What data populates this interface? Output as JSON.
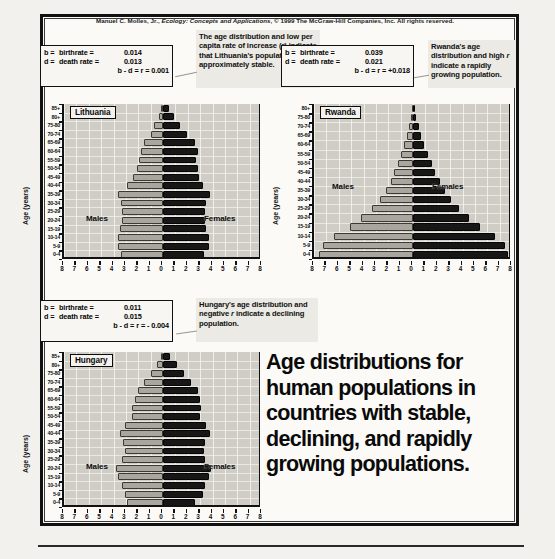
{
  "credit": {
    "prefix": "Manuel C. Molles, Jr., ",
    "italic": "Ecology: Concepts and Applications",
    "suffix": ", © 1999 The McGraw-Hill Companies, Inc. All rights reserved."
  },
  "caption": {
    "line1": "Age distributions for",
    "line2": "human populations in",
    "line3": "countries with stable,",
    "line4": "declining, and rapidly",
    "line5": "growing populations."
  },
  "annotations": {
    "lithuania_stats": {
      "b_label": "b =",
      "b_name": "birthrate =",
      "b_value": "0.014",
      "d_label": "d =",
      "d_name": "death rate =",
      "d_value": "0.013",
      "r_text": "b - d = r = 0.001"
    },
    "lithuania_note": "The age distribution and low per capita rate of increase (r) indicate that Lithuania's population is approximately stable.",
    "rwanda_stats": {
      "b_label": "b =",
      "b_name": "birthrate =",
      "b_value": "0.039",
      "d_label": "d =",
      "d_name": "death rate =",
      "d_value": "0.021",
      "r_text": "b - d = r = +0.018"
    },
    "rwanda_note": "Rwanda's age distribution and high r indicate a rapidly growing population.",
    "hungary_stats": {
      "b_label": "b =",
      "b_name": "birthrate =",
      "b_value": "0.011",
      "d_label": "d =",
      "d_name": "death rate =",
      "d_value": "0.015",
      "r_text": "b - d = r = - 0.004"
    },
    "hungary_note": "Hungary's age distribution and negative r indicate a declining population."
  },
  "common": {
    "ylabel": "Age (years)",
    "males_label": "Males",
    "females_label": "Females",
    "xticks": [
      "8",
      "7",
      "6",
      "5",
      "4",
      "3",
      "2",
      "1",
      "0",
      "1",
      "2",
      "3",
      "4",
      "5",
      "6",
      "7",
      "8"
    ]
  },
  "chart_data": [
    {
      "type": "bar",
      "title": "Lithuania",
      "subtype": "population-pyramid",
      "xlabel": "",
      "ylabel": "Age (years)",
      "xlim": [
        -8,
        8
      ],
      "grid": true,
      "legend_position": "in-plot",
      "categories": [
        "85+",
        "80+",
        "75-80",
        "70-74",
        "65-69",
        "60-64",
        "55-59",
        "50-54",
        "45-49",
        "40-44",
        "35-39",
        "30-34",
        "25-29",
        "20-24",
        "15-19",
        "10-14",
        "5-9",
        "0-4"
      ],
      "series": [
        {
          "name": "Males",
          "values": [
            0.15,
            0.35,
            0.7,
            1.0,
            1.5,
            1.8,
            1.9,
            2.1,
            2.4,
            2.9,
            3.6,
            3.4,
            3.3,
            3.3,
            3.5,
            3.6,
            3.6,
            3.4
          ]
        },
        {
          "name": "Females",
          "values": [
            0.45,
            0.9,
            1.4,
            1.9,
            2.6,
            2.8,
            2.7,
            2.8,
            2.9,
            3.2,
            3.8,
            3.5,
            3.4,
            3.4,
            3.5,
            3.7,
            3.7,
            3.3
          ]
        }
      ]
    },
    {
      "type": "bar",
      "title": "Rwanda",
      "subtype": "population-pyramid",
      "xlabel": "",
      "ylabel": "Age (years)",
      "xlim": [
        -8,
        8
      ],
      "grid": true,
      "legend_position": "in-plot",
      "categories": [
        "80+",
        "75-80",
        "70-74",
        "65-69",
        "60-64",
        "55-59",
        "50-54",
        "45-49",
        "40-44",
        "35-39",
        "30-34",
        "25-29",
        "20-24",
        "15-19",
        "10-14",
        "5-9",
        "0-4"
      ],
      "series": [
        {
          "name": "Males",
          "values": [
            0.12,
            0.2,
            0.35,
            0.5,
            0.7,
            0.95,
            1.2,
            1.5,
            1.8,
            2.2,
            2.7,
            3.3,
            4.2,
            5.1,
            6.4,
            7.3,
            7.6
          ]
        },
        {
          "name": "Females",
          "values": [
            0.18,
            0.28,
            0.45,
            0.65,
            0.9,
            1.2,
            1.5,
            1.8,
            2.2,
            2.6,
            3.1,
            3.7,
            4.5,
            5.4,
            6.6,
            7.4,
            7.7
          ]
        }
      ]
    },
    {
      "type": "bar",
      "title": "Hungary",
      "subtype": "population-pyramid",
      "xlabel": "",
      "ylabel": "Age (years)",
      "xlim": [
        -8,
        8
      ],
      "grid": true,
      "legend_position": "in-plot",
      "categories": [
        "85+",
        "80+",
        "75-80",
        "70-74",
        "65-69",
        "60-64",
        "55-59",
        "50-54",
        "45-49",
        "40-44",
        "35-39",
        "30-34",
        "25-29",
        "20-24",
        "15-19",
        "10-14",
        "5-9",
        "0-4"
      ],
      "series": [
        {
          "name": "Males",
          "values": [
            0.2,
            0.5,
            1.0,
            1.5,
            2.0,
            2.3,
            2.5,
            2.5,
            3.1,
            3.5,
            3.2,
            3.1,
            3.3,
            3.8,
            3.6,
            3.3,
            3.1,
            2.9
          ]
        },
        {
          "name": "Females",
          "values": [
            0.55,
            1.1,
            1.7,
            2.3,
            2.8,
            3.0,
            3.1,
            3.0,
            3.5,
            3.8,
            3.4,
            3.3,
            3.4,
            3.9,
            3.7,
            3.4,
            3.2,
            2.6
          ]
        }
      ]
    }
  ]
}
